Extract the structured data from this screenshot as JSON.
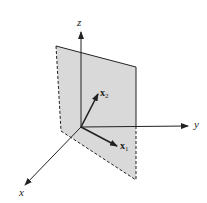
{
  "figure": {
    "type": "3d-coordinate-diagram",
    "colors": {
      "plane_fill": "#d9d9d9",
      "line": "#222222",
      "background": "#ffffff"
    },
    "axes": {
      "z": {
        "label": "z"
      },
      "y": {
        "label": "y"
      },
      "x": {
        "label": "x"
      }
    },
    "vectors": [
      {
        "name": "x1",
        "label_main": "x",
        "label_sub": "1"
      },
      {
        "name": "x2",
        "label_main": "x",
        "label_sub": "2"
      }
    ],
    "plane": {
      "edges": [
        "dashed-left",
        "solid-top",
        "solid-right-upper",
        "dashed-right-lower",
        "dashed-bottom"
      ]
    }
  }
}
